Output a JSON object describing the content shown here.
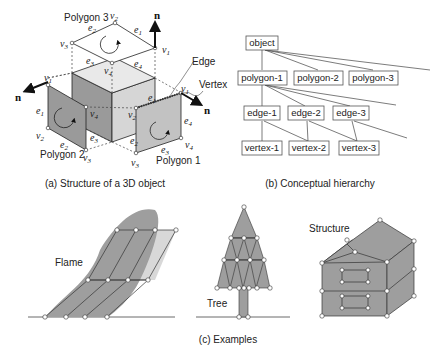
{
  "panel_a": {
    "caption": "(a) Structure of a 3D object",
    "polygons": [
      "Polygon 1",
      "Polygon 2",
      "Polygon 3"
    ],
    "labels": {
      "edge": "Edge",
      "vertex": "Vertex",
      "normal": "n"
    },
    "symbols": {
      "v": "v",
      "e": "e",
      "v1": "1",
      "v2": "2",
      "v3": "3",
      "v4": "4"
    }
  },
  "panel_b": {
    "caption": "(b) Conceptual hierarchy",
    "nodes": {
      "object": "object",
      "polygon1": "polygon-1",
      "polygon2": "polygon-2",
      "polygon3": "polygon-3",
      "edge1": "edge-1",
      "edge2": "edge-2",
      "edge3": "edge-3",
      "vertex1": "vertex-1",
      "vertex2": "vertex-2",
      "vertex3": "vertex-3"
    }
  },
  "panel_c": {
    "caption": "(c) Examples",
    "examples": [
      "Flame",
      "Tree",
      "Structure"
    ]
  },
  "colors": {
    "face_dark": "#9a9a9a",
    "face_mid": "#b5b5b5",
    "face_light": "#d6d6d6",
    "example_fill": "#9e9e9e",
    "line": "#222222"
  }
}
